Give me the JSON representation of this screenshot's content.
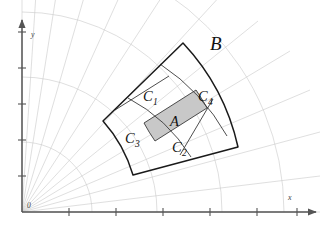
{
  "figure": {
    "background_color": "#ffffff",
    "width": 327,
    "height": 232
  },
  "axes": {
    "x_label": "x",
    "y_label": "y",
    "origin_label": "0",
    "axis_color": "#555555",
    "x_axis": {
      "start": [
        22,
        212
      ],
      "end": [
        318,
        212
      ],
      "arrow": true,
      "tick_count": 6
    },
    "y_axis": {
      "start": [
        22,
        212
      ],
      "end": [
        22,
        18
      ],
      "arrow": true,
      "tick_count": 5
    }
  },
  "grid": {
    "type": "polar",
    "grid_color": "#c9c9c9",
    "ray_count": 13,
    "arc_count": 4,
    "arc_radii": [
      70,
      135,
      200,
      262
    ],
    "ray_angles_deg": [
      0,
      7,
      15,
      23,
      31,
      39,
      47,
      55,
      63,
      71,
      79,
      86,
      90
    ]
  },
  "regions": {
    "outer_sector": {
      "name": "B",
      "label": "B",
      "label_pos": [
        210,
        47
      ],
      "fill": "none",
      "stroke": "#1a1a1a",
      "inner_radius": 142,
      "outer_radius": 223,
      "angle_start_deg": 25,
      "angle_end_deg": 59
    },
    "shaded": {
      "name": "A",
      "label": "A",
      "label_pos": [
        175,
        121
      ],
      "fill_color": "#c8c8c8",
      "stroke": "#3a3a3a"
    },
    "parts": [
      {
        "name": "C1",
        "label": "C",
        "subscript": "1",
        "label_pos": [
          150,
          98
        ]
      },
      {
        "name": "C2",
        "label": "C",
        "subscript": "2",
        "label_pos": [
          181,
          148
        ]
      },
      {
        "name": "C3",
        "label": "C",
        "subscript": "3",
        "label_pos": [
          134,
          140
        ]
      },
      {
        "name": "C4",
        "label": "C",
        "subscript": "4",
        "label_pos": [
          206,
          98
        ]
      }
    ]
  },
  "colors": {
    "shaded_fill": "#c8c8c8",
    "outline": "#1a1a1a",
    "divider": "#3a3a3a",
    "grid": "#c9c9c9",
    "axis": "#555555",
    "text": "#111111"
  }
}
